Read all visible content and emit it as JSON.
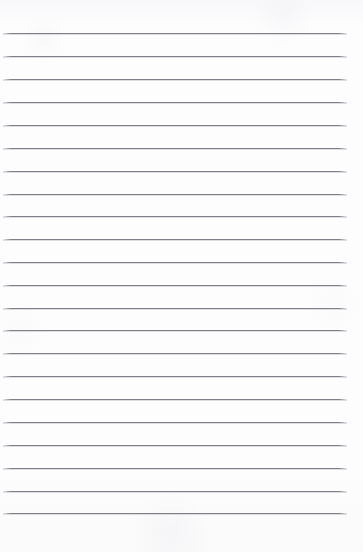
{
  "document": {
    "kind": "scanned-lined-paper",
    "title": "Blank ruled notebook page",
    "visible_text": "",
    "page_width": 363,
    "page_height": 552,
    "paper_color": "#fdfdfe",
    "rule_color": "#76767e",
    "rule_thickness_px": 1,
    "rule_left_x": 3,
    "rule_right_x": 347,
    "rule_length_px": 344,
    "first_rule_y": 33,
    "last_rule_y": 513,
    "rule_spacing_px": 22.9,
    "rule_count": 22,
    "top_margin_px": 33,
    "bottom_margin_px": 39,
    "left_margin_px": 3,
    "right_margin_px": 16,
    "has_vertical_margin_rule": false,
    "has_holes": false,
    "has_header": false,
    "has_handwriting": false
  },
  "rules": [
    {
      "index": 1,
      "y": 33
    },
    {
      "index": 2,
      "y": 56
    },
    {
      "index": 3,
      "y": 79
    },
    {
      "index": 4,
      "y": 102
    },
    {
      "index": 5,
      "y": 125
    },
    {
      "index": 6,
      "y": 148
    },
    {
      "index": 7,
      "y": 171
    },
    {
      "index": 8,
      "y": 194
    },
    {
      "index": 9,
      "y": 216
    },
    {
      "index": 10,
      "y": 239
    },
    {
      "index": 11,
      "y": 262
    },
    {
      "index": 12,
      "y": 285
    },
    {
      "index": 13,
      "y": 308
    },
    {
      "index": 14,
      "y": 330
    },
    {
      "index": 15,
      "y": 353
    },
    {
      "index": 16,
      "y": 376
    },
    {
      "index": 17,
      "y": 399
    },
    {
      "index": 18,
      "y": 422
    },
    {
      "index": 19,
      "y": 445
    },
    {
      "index": 20,
      "y": 468
    },
    {
      "index": 21,
      "y": 491
    },
    {
      "index": 22,
      "y": 513
    }
  ]
}
